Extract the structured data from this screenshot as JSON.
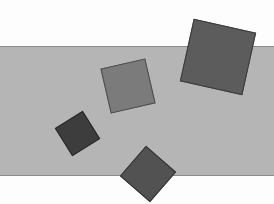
{
  "canvas": {
    "width": 274,
    "height": 204,
    "background": "#fdfdfd"
  },
  "band": {
    "x": 0,
    "y": 46,
    "width": 274,
    "height": 130,
    "fill": "#b5b5b5",
    "border": "#8a8a8a"
  },
  "squares": [
    {
      "id": "large-square",
      "cx": 218,
      "cy": 57,
      "size": 64,
      "rotation": 12.5,
      "fill": "#5c5c5c",
      "border": "#3a3a3a"
    },
    {
      "id": "medium-square",
      "cx": 128,
      "cy": 86,
      "size": 46,
      "rotation": -13,
      "fill": "#7b7b7b",
      "border": "#4a4a4a"
    },
    {
      "id": "small-square",
      "cx": 77,
      "cy": 133,
      "size": 33,
      "rotation": -32,
      "fill": "#3d3d3d",
      "border": "#2a2a2a"
    },
    {
      "id": "bottom-square",
      "cx": 147.5,
      "cy": 174,
      "size": 40,
      "rotation": 41,
      "fill": "#525252",
      "border": "#333333"
    }
  ]
}
